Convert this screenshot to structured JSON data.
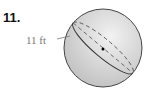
{
  "problem": {
    "number": "11.",
    "shape": "sphere",
    "measure_label": "11 ft",
    "measure_type": "diameter"
  },
  "colors": {
    "sphere_fill": "#d6d6d6",
    "outline": "#333333",
    "dashed": "#555555",
    "label_text": "#777777"
  }
}
